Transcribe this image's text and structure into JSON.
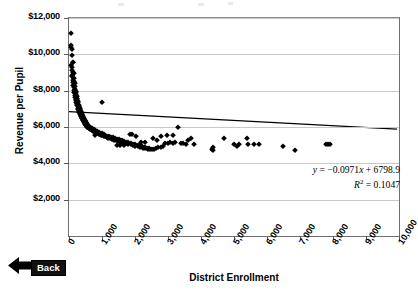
{
  "chart_data": {
    "type": "scatter",
    "title": "",
    "xlabel": "District Enrollment",
    "ylabel": "Revenue per Pupil",
    "xlim": [
      0,
      10000
    ],
    "ylim": [
      0,
      12000
    ],
    "grid": "horizontal",
    "legend": "none",
    "x_ticks": [
      "0",
      "1,000",
      "2,000",
      "3,000",
      "4,000",
      "5,000",
      "6,000",
      "7,000",
      "8,000",
      "9,000",
      "10,000"
    ],
    "y_ticks": [
      "$2,000",
      "$4,000",
      "$6,000",
      "$8,000",
      "$10,000",
      "$12,000"
    ],
    "y_tick_values": [
      2000,
      4000,
      6000,
      8000,
      10000,
      12000
    ],
    "x_tick_values": [
      0,
      1000,
      2000,
      3000,
      4000,
      5000,
      6000,
      7000,
      8000,
      9000,
      10000
    ],
    "trendline": {
      "slope": -0.0971,
      "intercept": 6798.9,
      "r_squared": 0.1047,
      "equation_text": "y = −0.0971x + 6798.9",
      "r2_text": "R² = 0.1047",
      "color": "#000000"
    },
    "marker": {
      "shape": "diamond",
      "color": "#000000",
      "size": 3.6
    },
    "points": [
      [
        70,
        11200
      ],
      [
        55,
        10500
      ],
      [
        60,
        10400
      ],
      [
        95,
        10300
      ],
      [
        80,
        9950
      ],
      [
        110,
        9600
      ],
      [
        130,
        9580
      ],
      [
        75,
        9400
      ],
      [
        100,
        9300
      ],
      [
        90,
        9150
      ],
      [
        120,
        9050
      ],
      [
        140,
        8950
      ],
      [
        85,
        8850
      ],
      [
        105,
        8800
      ],
      [
        150,
        8700
      ],
      [
        115,
        8600
      ],
      [
        160,
        8550
      ],
      [
        135,
        8450
      ],
      [
        170,
        8400
      ],
      [
        125,
        8300
      ],
      [
        180,
        8250
      ],
      [
        145,
        8200
      ],
      [
        190,
        8100
      ],
      [
        155,
        8050
      ],
      [
        200,
        8000
      ],
      [
        165,
        7950
      ],
      [
        210,
        7900
      ],
      [
        175,
        7850
      ],
      [
        220,
        7800
      ],
      [
        185,
        7750
      ],
      [
        230,
        7700
      ],
      [
        195,
        7650
      ],
      [
        240,
        7600
      ],
      [
        205,
        7560
      ],
      [
        250,
        7520
      ],
      [
        215,
        7480
      ],
      [
        990,
        7400
      ],
      [
        260,
        7440
      ],
      [
        225,
        7400
      ],
      [
        270,
        7360
      ],
      [
        235,
        7320
      ],
      [
        280,
        7280
      ],
      [
        245,
        7250
      ],
      [
        290,
        7220
      ],
      [
        255,
        7190
      ],
      [
        300,
        7160
      ],
      [
        265,
        7130
      ],
      [
        310,
        7100
      ],
      [
        275,
        7070
      ],
      [
        320,
        7040
      ],
      [
        285,
        7010
      ],
      [
        330,
        6990
      ],
      [
        295,
        6960
      ],
      [
        340,
        6930
      ],
      [
        305,
        6900
      ],
      [
        350,
        6880
      ],
      [
        315,
        6850
      ],
      [
        360,
        6830
      ],
      [
        325,
        6800
      ],
      [
        370,
        6780
      ],
      [
        335,
        6760
      ],
      [
        380,
        6730
      ],
      [
        345,
        6710
      ],
      [
        390,
        6690
      ],
      [
        355,
        6670
      ],
      [
        400,
        6650
      ],
      [
        365,
        6630
      ],
      [
        410,
        6610
      ],
      [
        375,
        6590
      ],
      [
        420,
        6570
      ],
      [
        385,
        6550
      ],
      [
        430,
        6530
      ],
      [
        395,
        6510
      ],
      [
        440,
        6500
      ],
      [
        405,
        6480
      ],
      [
        450,
        6460
      ],
      [
        415,
        6440
      ],
      [
        460,
        6430
      ],
      [
        425,
        6410
      ],
      [
        470,
        6390
      ],
      [
        435,
        6370
      ],
      [
        480,
        6360
      ],
      [
        445,
        6340
      ],
      [
        490,
        6320
      ],
      [
        455,
        6310
      ],
      [
        500,
        6290
      ],
      [
        465,
        6280
      ],
      [
        510,
        6260
      ],
      [
        475,
        6250
      ],
      [
        520,
        6230
      ],
      [
        485,
        6220
      ],
      [
        530,
        6200
      ],
      [
        495,
        6190
      ],
      [
        540,
        6170
      ],
      [
        505,
        6160
      ],
      [
        550,
        6140
      ],
      [
        515,
        6130
      ],
      [
        560,
        6120
      ],
      [
        525,
        6100
      ],
      [
        575,
        6090
      ],
      [
        535,
        6080
      ],
      [
        590,
        6060
      ],
      [
        545,
        6050
      ],
      [
        605,
        6040
      ],
      [
        555,
        6020
      ],
      [
        620,
        6010
      ],
      [
        565,
        6000
      ],
      [
        640,
        5990
      ],
      [
        580,
        5980
      ],
      [
        660,
        5970
      ],
      [
        600,
        5960
      ],
      [
        680,
        5940
      ],
      [
        625,
        5930
      ],
      [
        700,
        5920
      ],
      [
        650,
        5900
      ],
      [
        720,
        5890
      ],
      [
        670,
        5880
      ],
      [
        745,
        5870
      ],
      [
        690,
        5850
      ],
      [
        770,
        5840
      ],
      [
        715,
        5830
      ],
      [
        800,
        5820
      ],
      [
        740,
        5800
      ],
      [
        830,
        5790
      ],
      [
        765,
        5780
      ],
      [
        860,
        5760
      ],
      [
        790,
        5750
      ],
      [
        890,
        5740
      ],
      [
        815,
        5720
      ],
      [
        920,
        5700
      ],
      [
        845,
        5690
      ],
      [
        950,
        5680
      ],
      [
        875,
        5660
      ],
      [
        985,
        5650
      ],
      [
        905,
        5640
      ],
      [
        1020,
        5620
      ],
      [
        935,
        5600
      ],
      [
        1060,
        5590
      ],
      [
        965,
        5580
      ],
      [
        1100,
        5560
      ],
      [
        1010,
        5540
      ],
      [
        1150,
        5530
      ],
      [
        1055,
        5510
      ],
      [
        1200,
        5490
      ],
      [
        1100,
        5480
      ],
      [
        1260,
        5460
      ],
      [
        1145,
        5440
      ],
      [
        1320,
        5430
      ],
      [
        1195,
        5410
      ],
      [
        1380,
        5390
      ],
      [
        1250,
        5380
      ],
      [
        1440,
        5360
      ],
      [
        1310,
        5340
      ],
      [
        1500,
        5330
      ],
      [
        1370,
        5310
      ],
      [
        1560,
        5290
      ],
      [
        1430,
        5270
      ],
      [
        1620,
        5260
      ],
      [
        1490,
        5240
      ],
      [
        1680,
        5220
      ],
      [
        1550,
        5200
      ],
      [
        1740,
        5190
      ],
      [
        1610,
        5170
      ],
      [
        1800,
        5150
      ],
      [
        1670,
        5140
      ],
      [
        1870,
        5120
      ],
      [
        1730,
        5100
      ],
      [
        1940,
        5090
      ],
      [
        1800,
        5070
      ],
      [
        2010,
        5050
      ],
      [
        1870,
        5040
      ],
      [
        2080,
        5020
      ],
      [
        1940,
        5000
      ],
      [
        2150,
        4990
      ],
      [
        2010,
        4970
      ],
      [
        2220,
        4950
      ],
      [
        2090,
        4930
      ],
      [
        2290,
        4910
      ],
      [
        2160,
        4890
      ],
      [
        2360,
        4870
      ],
      [
        2240,
        4850
      ],
      [
        2430,
        4840
      ],
      [
        2310,
        4820
      ],
      [
        2500,
        4800
      ],
      [
        2390,
        4790
      ],
      [
        2570,
        4780
      ],
      [
        2460,
        4770
      ],
      [
        790,
        5540
      ],
      [
        1560,
        5000
      ],
      [
        1680,
        4990
      ],
      [
        1460,
        5010
      ],
      [
        2640,
        4860
      ],
      [
        2710,
        4880
      ],
      [
        2780,
        4900
      ],
      [
        2850,
        4930
      ],
      [
        2920,
        5100
      ],
      [
        2990,
        5120
      ],
      [
        3060,
        5180
      ],
      [
        3140,
        5100
      ],
      [
        3220,
        5150
      ],
      [
        3300,
        5980
      ],
      [
        3380,
        5120
      ],
      [
        3460,
        5100
      ],
      [
        3540,
        5050
      ],
      [
        3620,
        5300
      ],
      [
        3700,
        5380
      ],
      [
        3780,
        5050
      ],
      [
        4330,
        4780
      ],
      [
        4360,
        4900
      ],
      [
        4370,
        4760
      ],
      [
        4700,
        5380
      ],
      [
        5010,
        5050
      ],
      [
        5080,
        4980
      ],
      [
        5140,
        5060
      ],
      [
        5380,
        5400
      ],
      [
        5410,
        5060
      ],
      [
        5600,
        5060
      ],
      [
        5760,
        5060
      ],
      [
        6480,
        4980
      ],
      [
        6840,
        4760
      ],
      [
        7790,
        5060
      ],
      [
        7860,
        5090
      ],
      [
        7900,
        5060
      ],
      [
        2800,
        5480
      ],
      [
        2960,
        5540
      ],
      [
        3140,
        5560
      ],
      [
        2550,
        5380
      ],
      [
        2660,
        5260
      ],
      [
        1900,
        5600
      ],
      [
        2040,
        5520
      ],
      [
        1840,
        5620
      ],
      [
        2190,
        5180
      ],
      [
        2310,
        5160
      ]
    ]
  },
  "controls": {
    "back_label": "Back",
    "back_arrow_icon": "left-arrow-icon"
  }
}
